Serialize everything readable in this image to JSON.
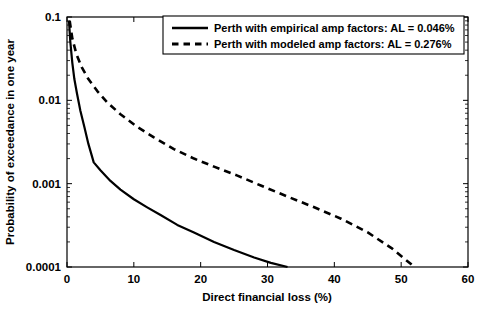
{
  "chart_data": {
    "type": "line",
    "title": "",
    "xlabel": "Direct financial loss (%)",
    "ylabel": "Probability of exceedance in one year",
    "xlim": [
      0,
      60
    ],
    "ylim": [
      0.0001,
      0.1
    ],
    "yscale": "log",
    "xscale": "linear",
    "grid": false,
    "legend_position": "top-right",
    "xticks": [
      0,
      10,
      20,
      30,
      40,
      50,
      60
    ],
    "xtick_labels": [
      "0",
      "10",
      "20",
      "30",
      "40",
      "50",
      "60"
    ],
    "yticks": [
      0.1,
      0.01,
      0.001,
      0.0001
    ],
    "ytick_labels": [
      "0.1",
      "0.01",
      "0.001",
      "0.0001"
    ],
    "series": [
      {
        "name": "Perth with empirical amp factors: AL = 0.046%",
        "style": "solid",
        "color": "#000000",
        "x": [
          0.3,
          0.5,
          0.8,
          1.1,
          1.5,
          2.0,
          2.6,
          3.2,
          4.0,
          5.0,
          6.5,
          8.0,
          10.0,
          12.0,
          14.0,
          16.5,
          19.0,
          22.0,
          25.0,
          28.0,
          30.5,
          33.0
        ],
        "y": [
          0.09,
          0.05,
          0.028,
          0.018,
          0.012,
          0.0075,
          0.0048,
          0.003,
          0.0018,
          0.00145,
          0.00108,
          0.00085,
          0.00065,
          0.00052,
          0.00042,
          0.00032,
          0.00026,
          0.0002,
          0.00016,
          0.00013,
          0.000112,
          0.0001
        ]
      },
      {
        "name": "Perth with modeled amp factors: AL = 0.276%",
        "style": "dashed",
        "color": "#000000",
        "x": [
          0.4,
          0.8,
          1.4,
          2.2,
          3.2,
          4.5,
          6.0,
          8.0,
          10.5,
          13.0,
          16.0,
          19.0,
          22.0,
          25.5,
          29.0,
          33.0,
          37.0,
          41.0,
          45.0,
          48.5,
          52.0
        ],
        "y": [
          0.09,
          0.055,
          0.036,
          0.025,
          0.018,
          0.013,
          0.0095,
          0.0068,
          0.0048,
          0.0036,
          0.0026,
          0.002,
          0.0016,
          0.00125,
          0.00095,
          0.0007,
          0.00052,
          0.00038,
          0.00026,
          0.00017,
          0.0001
        ]
      }
    ]
  },
  "legend": {
    "entries": [
      {
        "label": "Perth with empirical amp factors: AL = 0.046%",
        "style": "solid"
      },
      {
        "label": "Perth with modeled amp factors: AL = 0.276%",
        "style": "dashed"
      }
    ]
  },
  "axes": {
    "x": {
      "label": "Direct financial loss (%)",
      "tick_labels": [
        "0",
        "10",
        "20",
        "30",
        "40",
        "50",
        "60"
      ]
    },
    "y": {
      "label": "Probability of exceedance in one year",
      "tick_labels": [
        "0.1",
        "0.01",
        "0.001",
        "0.0001"
      ]
    }
  }
}
